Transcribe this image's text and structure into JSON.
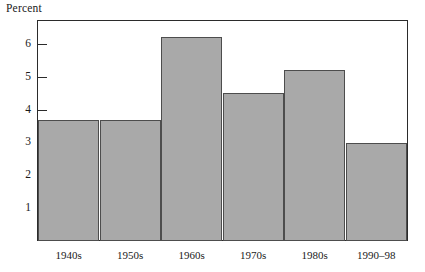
{
  "chart_data": {
    "type": "bar",
    "title": "",
    "ylabel": "Percent",
    "xlabel": "",
    "categories": [
      "1940s",
      "1950s",
      "1960s",
      "1970s",
      "1980s",
      "1990–98"
    ],
    "values": [
      3.7,
      3.7,
      6.2,
      4.5,
      5.2,
      3.0
    ],
    "ylim": [
      0,
      6.7
    ],
    "yticks": [
      1,
      2,
      3,
      4,
      5,
      6
    ],
    "ytick_labels": [
      "1",
      "2",
      "3",
      "4",
      "5",
      "6"
    ],
    "grid": false,
    "legend": null,
    "bar_color": "#a9a9a9",
    "bar_edge_color": "#4d4d4d",
    "frame_color": "#2b2b2b"
  }
}
